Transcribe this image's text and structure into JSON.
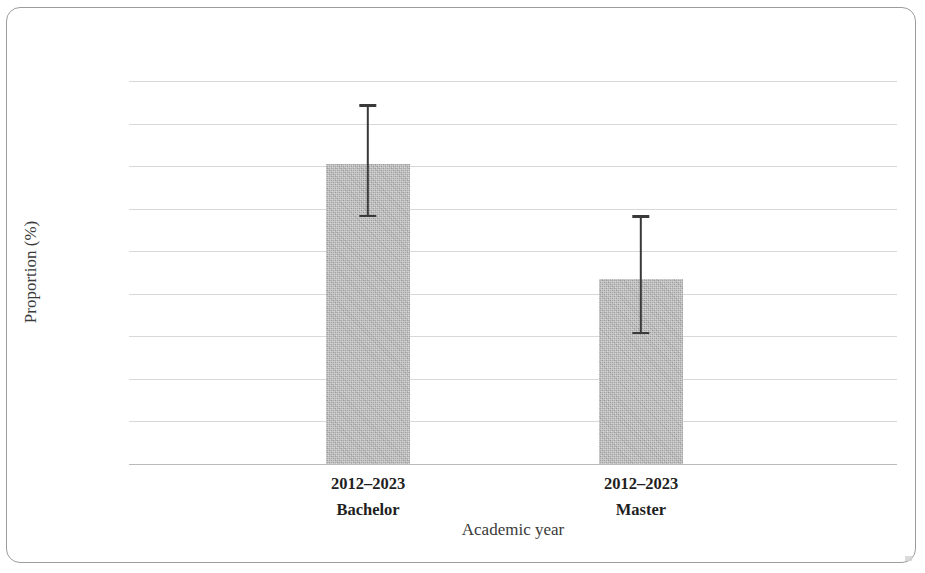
{
  "figure": {
    "frame_color": "#9c9c9c",
    "background": "#ffffff"
  },
  "chart_data": {
    "type": "bar",
    "title": "",
    "xlabel": "Academic year",
    "ylabel": "Proportion (%)",
    "categories": [
      "2012–2023\nBachelor",
      "2012–2023\nMaster"
    ],
    "category_lines": [
      {
        "line1": "2012–2023",
        "line2": "Bachelor"
      },
      {
        "line1": "2012–2023",
        "line2": "Master"
      }
    ],
    "values": [
      30.81,
      30.27
    ],
    "error_low": [
      30.56,
      30.01
    ],
    "error_high": [
      31.09,
      30.57
    ],
    "ylim": [
      29.4,
      31.2
    ],
    "ytick_step": 0.2,
    "yticks": [
      "31.2",
      "31",
      "30.8",
      "30.6",
      "30.4",
      "30.2",
      "30",
      "29.8",
      "29.6",
      "29.4"
    ],
    "ytick_values": [
      31.2,
      31,
      30.8,
      30.6,
      30.4,
      30.2,
      30,
      29.8,
      29.6,
      29.4
    ],
    "grid": true,
    "legend": null,
    "bar_color": "#b6b6b6",
    "errorbar_color": "#3a3a3a",
    "gridline_color": "#d8d8d8"
  }
}
